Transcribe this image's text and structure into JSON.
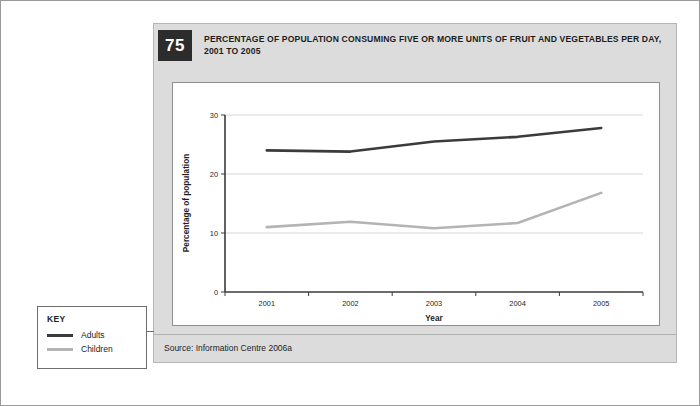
{
  "figure": {
    "number": "75",
    "title": "PERCENTAGE OF POPULATION CONSUMING FIVE OR MORE UNITS OF FRUIT AND VEGETABLES PER DAY, 2001 TO 2005",
    "source": "Source: Information Centre 2006a"
  },
  "key": {
    "title": "KEY",
    "items": [
      {
        "label": "Adults",
        "color": "#3b3b3b"
      },
      {
        "label": "Children",
        "color": "#b4b4b4"
      }
    ]
  },
  "chart_data": {
    "type": "line",
    "title": "PERCENTAGE OF POPULATION CONSUMING FIVE OR MORE UNITS OF FRUIT AND VEGETABLES PER DAY, 2001 TO 2005",
    "xlabel": "Year",
    "ylabel": "Percentage of population",
    "categories": [
      "2001",
      "2002",
      "2003",
      "2004",
      "2005"
    ],
    "x_tick_labels": [
      "2001",
      "2002",
      "2003",
      "2004",
      "2005"
    ],
    "y_tick_labels": [
      "0",
      "10",
      "20",
      "30"
    ],
    "y_ticks": [
      0,
      10,
      20,
      30
    ],
    "ylim": [
      0,
      30
    ],
    "grid": "horizontal",
    "legend_position": "external-left",
    "series": [
      {
        "name": "Adults",
        "color": "#3b3b3b",
        "values": [
          24.0,
          23.8,
          25.5,
          26.3,
          27.8
        ]
      },
      {
        "name": "Children",
        "color": "#b4b4b4",
        "values": [
          11.0,
          11.9,
          10.8,
          11.7,
          16.8
        ]
      }
    ]
  }
}
